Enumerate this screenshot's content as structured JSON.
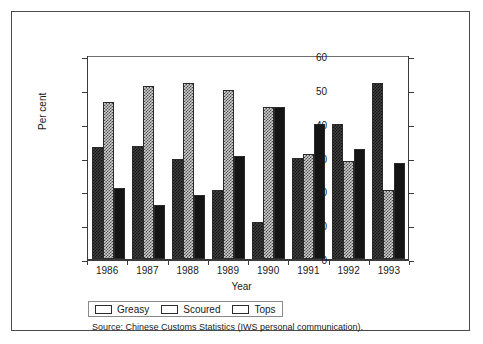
{
  "chart_data": {
    "type": "bar",
    "title": "",
    "xlabel": "Year",
    "ylabel": "Per cent",
    "categories": [
      "1986",
      "1987",
      "1988",
      "1989",
      "1990",
      "1991",
      "1992",
      "1993"
    ],
    "series": [
      {
        "name": "Greasy",
        "values": [
          33,
          33.5,
          29.5,
          20.5,
          11,
          30,
          40,
          52
        ]
      },
      {
        "name": "Scoured",
        "values": [
          46.5,
          51,
          52,
          50,
          45,
          31,
          29,
          20.5
        ]
      },
      {
        "name": "Tops",
        "values": [
          21,
          16,
          19,
          30.5,
          45,
          40,
          32.5,
          28.5
        ]
      }
    ],
    "ylim": [
      0,
      60
    ],
    "yticks": [
      0,
      10,
      20,
      30,
      40,
      50,
      60
    ],
    "ylim_right": [
      0,
      60
    ],
    "yticks_right": [
      0,
      10,
      20,
      30,
      40,
      50,
      60
    ],
    "grid": false,
    "legend_position": "bottom-left",
    "dual_axis": true
  },
  "axes": {
    "y_left_title": "Per cent",
    "y_left_ticks": [
      "60",
      "50",
      "40",
      "30",
      "20",
      "10",
      "0"
    ],
    "y_right_ticks": [
      "60",
      "50",
      "40",
      "30",
      "20",
      "10",
      "0"
    ],
    "x_title": "Year",
    "x_ticks": [
      "1986",
      "1987",
      "1988",
      "1989",
      "1990",
      "1991",
      "1992",
      "1993"
    ]
  },
  "legend": {
    "items": [
      {
        "label": "Greasy",
        "pattern": "dark-checker"
      },
      {
        "label": "Scoured",
        "pattern": "light-checker"
      },
      {
        "label": "Tops",
        "pattern": "solid-black"
      }
    ]
  },
  "source": {
    "text": "Source: Chinese Customs Statistics (IWS personal communication)."
  },
  "colors": {
    "greasy": "#3f3f3f",
    "scoured": "#cfcfcf",
    "tops": "#141414",
    "axis": "#3a3a3a",
    "frame": "#4a4a4a",
    "background": "#ffffff"
  }
}
